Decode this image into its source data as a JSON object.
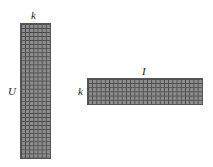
{
  "diagram": {
    "type": "matrix-factorization",
    "user_matrix": {
      "row_label": "U",
      "col_label": "k",
      "rows": 33,
      "cols": 7,
      "fill_color": "#8c8c8c",
      "grid_color": "#4a4a4a"
    },
    "item_matrix": {
      "row_label": "k",
      "col_label": "I",
      "rows": 6,
      "cols": 27,
      "fill_color": "#8c8c8c",
      "grid_color": "#4a4a4a"
    }
  }
}
